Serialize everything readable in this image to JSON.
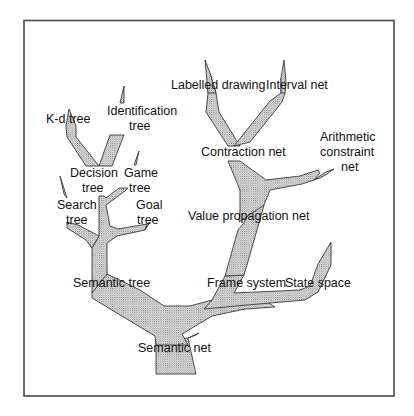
{
  "diagram": {
    "title": "",
    "colors": {
      "background": "#ffffff",
      "frame": "#4a4a4a",
      "branch_outline": "#3a3a3a",
      "branch_stipple": "#6e6e6e",
      "text": "#111111"
    },
    "nodes": [
      {
        "id": "semantic-net",
        "lines": [
          "Semantic net"
        ]
      },
      {
        "id": "semantic-tree",
        "lines": [
          "Semantic tree"
        ]
      },
      {
        "id": "frame-system",
        "lines": [
          "Frame system"
        ]
      },
      {
        "id": "state-space",
        "lines": [
          "State space"
        ]
      },
      {
        "id": "value-propagation-net",
        "lines": [
          "Value propagation net"
        ]
      },
      {
        "id": "contraction-net",
        "lines": [
          "Contraction net"
        ]
      },
      {
        "id": "labelled-drawing",
        "lines": [
          "Labelled drawing"
        ]
      },
      {
        "id": "interval-net",
        "lines": [
          "Interval net"
        ]
      },
      {
        "id": "arithmetic-constraint-net",
        "lines": [
          "Arithmetic",
          "constraint",
          "net"
        ]
      },
      {
        "id": "k-d-tree",
        "lines": [
          "K-d tree"
        ]
      },
      {
        "id": "identification-tree",
        "lines": [
          "Identification",
          "tree"
        ]
      },
      {
        "id": "decision-tree",
        "lines": [
          "Decision",
          "tree"
        ]
      },
      {
        "id": "game-tree",
        "lines": [
          "Game",
          "tree"
        ]
      },
      {
        "id": "search-tree",
        "lines": [
          "Search",
          "tree"
        ]
      },
      {
        "id": "goal-tree",
        "lines": [
          "Goal",
          "tree"
        ]
      }
    ],
    "edges": [
      {
        "from": "semantic-net",
        "to": "semantic-tree"
      },
      {
        "from": "semantic-net",
        "to": "frame-system"
      },
      {
        "from": "frame-system",
        "to": "state-space"
      },
      {
        "from": "frame-system",
        "to": "value-propagation-net"
      },
      {
        "from": "value-propagation-net",
        "to": "contraction-net"
      },
      {
        "from": "value-propagation-net",
        "to": "arithmetic-constraint-net"
      },
      {
        "from": "contraction-net",
        "to": "labelled-drawing"
      },
      {
        "from": "contraction-net",
        "to": "interval-net"
      },
      {
        "from": "semantic-tree",
        "to": "search-tree"
      },
      {
        "from": "semantic-tree",
        "to": "goal-tree"
      },
      {
        "from": "semantic-tree",
        "to": "decision-tree"
      },
      {
        "from": "semantic-tree",
        "to": "game-tree"
      },
      {
        "from": "decision-tree",
        "to": "k-d-tree"
      },
      {
        "from": "decision-tree",
        "to": "identification-tree"
      }
    ]
  }
}
